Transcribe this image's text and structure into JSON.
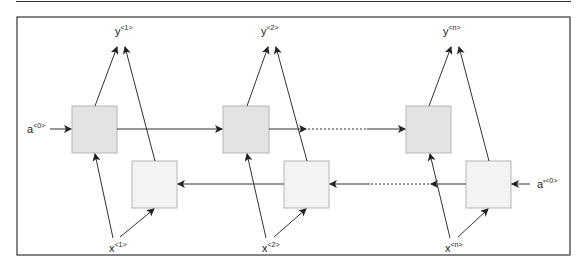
{
  "diagram": {
    "outputs": [
      {
        "base": "y",
        "sup": "<1>"
      },
      {
        "base": "y",
        "sup": "<2>"
      },
      {
        "base": "y",
        "sup": "<n>"
      }
    ],
    "inputs": [
      {
        "base": "x",
        "sup": "<1>"
      },
      {
        "base": "x",
        "sup": "<2>"
      },
      {
        "base": "x",
        "sup": "<n>"
      }
    ],
    "forward_initial": {
      "base": "a",
      "sup": "<0>"
    },
    "backward_initial": {
      "base": "a'",
      "sup": "<0>"
    },
    "colors": {
      "forward_cell": "#e3e3e3",
      "backward_cell": "#f3f3f3",
      "cell_border": "#b5b5b5",
      "line": "#333333",
      "frame": "#444444"
    }
  }
}
